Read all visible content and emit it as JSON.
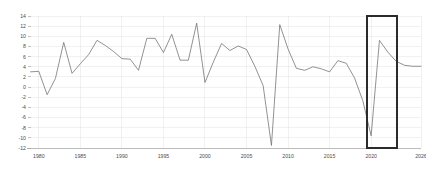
{
  "chart_data": {
    "type": "line",
    "title": "",
    "subtitle": "",
    "xlabel": "",
    "ylabel": "",
    "xlim": [
      1979,
      2026
    ],
    "ylim": [
      -12,
      14
    ],
    "grid": true,
    "legend": false,
    "legend_position": "none",
    "y_ticks": [
      14,
      12,
      10,
      8,
      6,
      4,
      2,
      0,
      -2,
      -4,
      -6,
      -8,
      -10,
      -12
    ],
    "y_tick_labels": [
      "14",
      "12",
      "10",
      "8",
      "6",
      "4",
      "2",
      "0",
      "-2",
      "-4",
      "-6",
      "-8",
      "-10",
      "-12"
    ],
    "x_ticks": [
      1980,
      1985,
      1990,
      1995,
      2000,
      2005,
      2010,
      2015,
      2020,
      2026
    ],
    "x_tick_labels": [
      "1980",
      "1985",
      "1990",
      "1995",
      "2000",
      "2005",
      "2010",
      "2015",
      "2020",
      "2026"
    ],
    "series": [
      {
        "name": "series-1",
        "color": "#6e6e6e",
        "x": [
          1979,
          1980,
          1981,
          1982,
          1983,
          1984,
          1985,
          1986,
          1987,
          1988,
          1989,
          1990,
          1991,
          1992,
          1993,
          1994,
          1995,
          1996,
          1997,
          1998,
          1999,
          2000,
          2001,
          2002,
          2003,
          2004,
          2005,
          2006,
          2007,
          2008,
          2009,
          2010,
          2011,
          2012,
          2013,
          2014,
          2015,
          2016,
          2017,
          2018,
          2019,
          2020,
          2021,
          2022,
          2023,
          2024,
          2025,
          2026
        ],
        "y": [
          3.0,
          3.1,
          -1.5,
          1.7,
          8.8,
          2.7,
          4.6,
          6.4,
          9.2,
          8.2,
          7.0,
          5.6,
          5.5,
          3.3,
          9.6,
          9.6,
          6.8,
          10.4,
          5.3,
          5.3,
          12.6,
          0.9,
          4.9,
          8.6,
          7.2,
          8.1,
          7.4,
          4.1,
          0.3,
          -11.5,
          12.3,
          7.5,
          3.7,
          3.3,
          4.0,
          3.6,
          3.0,
          5.2,
          4.7,
          1.8,
          -2.7,
          -9.6,
          9.2,
          6.9,
          5.1,
          4.3,
          4.1,
          4.1
        ]
      }
    ],
    "annotations": [
      {
        "type": "rect-highlight",
        "name": "highlight-box-2020-2023",
        "x_start": 2019.5,
        "x_end": 2023.1,
        "y_start": -12,
        "y_end": 14,
        "color": "#2b2b2b"
      }
    ]
  },
  "axes": {
    "y_axis_name": "y-axis",
    "x_axis_name": "x-axis"
  }
}
